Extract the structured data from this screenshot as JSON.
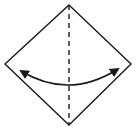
{
  "diagram": {
    "type": "origami-fold-step",
    "background": "#ffffff",
    "stroke_color": "#1a1a1a",
    "shape": {
      "kind": "diamond",
      "vertices": [
        [
          69,
          5
        ],
        [
          131,
          64
        ],
        [
          69,
          125
        ],
        [
          5,
          64
        ]
      ]
    },
    "fold_line": {
      "style": "dashed",
      "from": [
        69,
        5
      ],
      "to": [
        69,
        125
      ]
    },
    "arrow": {
      "kind": "curved-double-headed",
      "from": [
        20,
        70
      ],
      "to": [
        119,
        68
      ],
      "via": [
        69,
        87
      ]
    }
  }
}
